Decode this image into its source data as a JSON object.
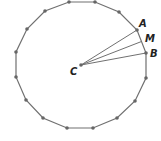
{
  "diagram": {
    "type": "regular-polygon",
    "sides": 16,
    "stroke_color": "#707070",
    "vertex_color": "#666666",
    "vertices": [
      [
        69,
        2
      ],
      [
        95,
        2
      ],
      [
        119,
        12
      ],
      [
        137,
        30
      ],
      [
        146,
        53
      ],
      [
        146,
        78
      ],
      [
        135,
        101
      ],
      [
        117,
        118
      ],
      [
        93,
        128
      ],
      [
        67,
        128
      ],
      [
        43,
        118
      ],
      [
        26,
        100
      ],
      [
        16,
        77
      ],
      [
        16,
        52
      ],
      [
        27,
        29
      ],
      [
        45,
        11
      ]
    ],
    "center": {
      "label": "C",
      "x": 81,
      "y": 65,
      "label_x": 70,
      "label_y": 75
    },
    "points": [
      {
        "label": "A",
        "x": 137,
        "y": 30,
        "label_x": 139,
        "label_y": 27
      },
      {
        "label": "M",
        "x": 141.5,
        "y": 41.5,
        "label_x": 145,
        "label_y": 42
      },
      {
        "label": "B",
        "x": 146,
        "y": 53,
        "label_x": 150,
        "label_y": 57
      }
    ],
    "segments": [
      [
        "C",
        "A"
      ],
      [
        "C",
        "M"
      ],
      [
        "C",
        "B"
      ]
    ]
  }
}
